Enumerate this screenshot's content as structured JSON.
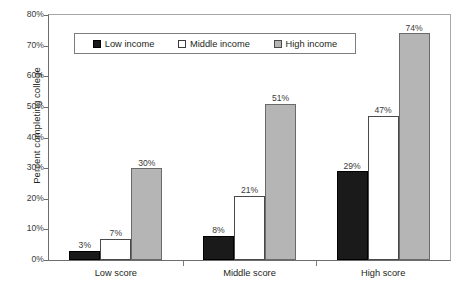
{
  "chart_data": {
    "type": "bar",
    "title": "",
    "xlabel": "",
    "ylabel": "Percent completing college",
    "categories": [
      "Low score",
      "Middle score",
      "High score"
    ],
    "series": [
      {
        "name": "Low income",
        "color": "#1a1a1a",
        "values": [
          3,
          7,
          30
        ]
      },
      {
        "name": "Middle income",
        "color": "#ffffff",
        "values": [
          8,
          21,
          51
        ]
      },
      {
        "name": "High income",
        "color": "#b5b5b5",
        "values": [
          30,
          51,
          74
        ]
      }
    ],
    "value_labels": [
      [
        "3%",
        "7%",
        "30%"
      ],
      [
        "8%",
        "21%",
        "51%"
      ],
      [
        "29%",
        "47%",
        "74%"
      ]
    ],
    "group_values": [
      [
        3,
        7,
        30
      ],
      [
        8,
        21,
        51
      ],
      [
        29,
        47,
        74
      ]
    ],
    "ylim": [
      0,
      80
    ],
    "ytick_values": [
      80,
      70,
      60,
      50,
      40,
      30,
      20,
      10,
      0
    ],
    "ytick_labels": [
      "80%",
      "70%",
      "60%",
      "50%",
      "40%",
      "30%",
      "20%",
      "10%",
      "0%"
    ],
    "grid": false,
    "legend_position": "top-inside"
  },
  "legend": {
    "items": [
      {
        "label": "Low income",
        "swatch": "filled-black-square"
      },
      {
        "label": "Middle income",
        "swatch": "empty-white-square"
      },
      {
        "label": "High income",
        "swatch": "filled-gray-square"
      }
    ]
  },
  "axes": {
    "y_title": "Percent completing college",
    "y_labels": [
      "80%",
      "70%",
      "60%",
      "50%",
      "40%",
      "30%",
      "20%",
      "10%",
      "0%"
    ],
    "x_labels": [
      "Low score",
      "Middle score",
      "High score"
    ]
  }
}
